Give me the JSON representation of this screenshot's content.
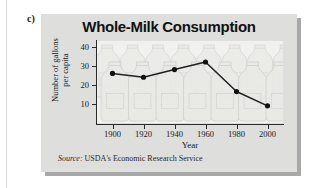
{
  "figure": {
    "item_label": "c)",
    "source_prefix": "Source:",
    "source_text": "USDA's Economic Research Service"
  },
  "colors": {
    "panel_bg": "#dededc",
    "panel_shadow": "#a8a8a8",
    "plot_bg": "#f1f1ef",
    "axis": "#2b2b2b",
    "line": "#231f20",
    "marker": "#111111",
    "jug_outline": "#d2d2ce",
    "jug_fill": "#e9e9e6",
    "text": "#1a1a1a"
  },
  "chart_data": {
    "type": "line",
    "title": "Whole-Milk Consumption",
    "xlabel": "Year",
    "ylabel": "Number of gallons per capita",
    "ylabel_lines": [
      "Number of gallons",
      "per capita"
    ],
    "x": [
      1900,
      1920,
      1940,
      1960,
      1980,
      2000
    ],
    "values": [
      26,
      24,
      28,
      32,
      16.5,
      9
    ],
    "xticks": [
      1900,
      1920,
      1940,
      1960,
      1980,
      2000
    ],
    "xtick_labels": [
      "1900",
      "1920",
      "1940",
      "1960",
      "1980",
      "2000"
    ],
    "yticks": [
      10,
      20,
      30,
      40
    ],
    "ytick_labels": [
      "10",
      "20",
      "30",
      "40"
    ],
    "xlim": [
      1890,
      2010
    ],
    "ylim": [
      0,
      43
    ],
    "grid": false,
    "legend": false,
    "markers": "filled-circle",
    "background_illustration": "milk-jugs"
  }
}
